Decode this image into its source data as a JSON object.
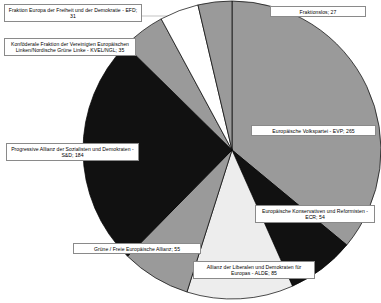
{
  "chart_data": {
    "type": "pie",
    "title": "",
    "subtitle": "",
    "xlabel": "",
    "ylabel": "",
    "legend_position": "callout-labels",
    "grid": false,
    "total": 736,
    "unit": "Sitze",
    "start_angle_deg": 0,
    "direction": "clockwise",
    "categories": [
      "Europäische Volkspartei - EVP",
      "Europäische Konservativen und Reformisten - ECR",
      "Allianz der Liberalen und Demokraten für Europas - ALDE",
      "Grüne / Freie Europäische Allianz",
      "Progressive Allianz der Sozialisten und Demokraten - S&D",
      "Konföderale Fraktion der Vereinigten Europäischen Linken/Nordische Grüne Linke - KVEL/NGL",
      "Fraktion Europa der Freiheit und der Demokratie - EFD",
      "Fraktionslos"
    ],
    "values": [
      265,
      54,
      85,
      55,
      184,
      35,
      31,
      27
    ],
    "colors": [
      "#9a9a9a",
      "#111111",
      "#ededed",
      "#9a9a9a",
      "#111111",
      "#9a9a9a",
      "#ffffff",
      "#9a9a9a"
    ],
    "slices": [
      {
        "key": "evp",
        "label": "Europäische Volkspartei - EVP",
        "value": 265,
        "text": "Europäische Volkspartei - EVP; 265",
        "color": "#9a9a9a"
      },
      {
        "key": "ecr",
        "label": "Europäische Konservativen und Reformisten - ECR",
        "value": 54,
        "text": "Europäische Konservativen und Reformisten - ECR; 54",
        "color": "#111111"
      },
      {
        "key": "alde",
        "label": "Allianz der Liberalen und Demokraten für Europas - ALDE",
        "value": 85,
        "text": "Allianz der Liberalen und Demokraten für Europas - ALDE; 85",
        "color": "#ededed"
      },
      {
        "key": "gruene",
        "label": "Grüne / Freie Europäische Allianz",
        "value": 55,
        "text": "Grüne / Freie Europäische Allianz; 55",
        "color": "#9a9a9a"
      },
      {
        "key": "sd",
        "label": "Progressive Allianz der Sozialisten und Demokraten - S&D",
        "value": 184,
        "text": "Progressive Allianz der Sozialisten und Demokraten - S&D; 184",
        "color": "#111111"
      },
      {
        "key": "kvel",
        "label": "Konföderale Fraktion der Vereinigten Europäischen Linken/Nordische Grüne Linke - KVEL/NGL",
        "value": 35,
        "text": "Konföderale Fraktion der Vereinigten Europäischen Linken/Nordische Grüne Linke - KVEL/NGL; 35",
        "color": "#9a9a9a"
      },
      {
        "key": "efd",
        "label": "Fraktion Europa der Freiheit und der Demokratie - EFD",
        "value": 31,
        "text": "Fraktion Europa der Freiheit und der Demokratie - EFD; 31",
        "color": "#ffffff"
      },
      {
        "key": "frakt",
        "label": "Fraktionslos",
        "value": 27,
        "text": "Fraktionslos; 27",
        "color": "#9a9a9a"
      }
    ]
  },
  "labels": {
    "efd": "Fraktion Europa der Freiheit und der Demokratie - EFD; 31",
    "kvel": "Konföderale Fraktion der Vereinigten Europäischen Linken/Nordische Grüne Linke - KVEL/NGL; 35",
    "sd": "Progressive Allianz der Sozialisten und Demokraten - S&D; 184",
    "gruene": "Grüne / Freie Europäische Allianz; 55",
    "alde": "Allianz der Liberalen und Demokraten für Europas - ALDE; 85",
    "ecr": "Europäische Konservativen und Reformisten - ECR; 54",
    "evp": "Europäische Volkspartei - EVP; 265",
    "fraktionslos": "Fraktionslos; 27"
  }
}
